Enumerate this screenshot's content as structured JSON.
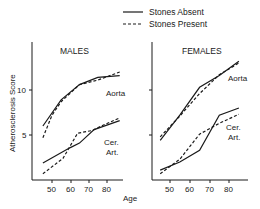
{
  "chart_data": [
    {
      "type": "line",
      "title": "MALES",
      "xlabel": "Age",
      "ylabel": "Atherosclerosis Score",
      "xticks": [
        50,
        60,
        70,
        80
      ],
      "yticks": [
        5,
        10
      ],
      "xlim": [
        40,
        90
      ],
      "ylim": [
        0,
        14
      ],
      "grid": false,
      "series": [
        {
          "name": "Stones Absent",
          "group": "Aorta",
          "style": "solid",
          "x": [
            45,
            55,
            65,
            75,
            87
          ],
          "y": [
            6.0,
            8.9,
            10.6,
            11.4,
            11.6
          ]
        },
        {
          "name": "Stones Present",
          "group": "Aorta",
          "style": "dashed",
          "x": [
            45,
            50,
            55,
            65,
            75,
            87
          ],
          "y": [
            4.7,
            7.2,
            8.7,
            10.6,
            11.1,
            12.0
          ]
        },
        {
          "name": "Stones Absent",
          "group": "Cer. Art.",
          "style": "solid",
          "x": [
            45,
            60,
            65,
            73,
            87
          ],
          "y": [
            1.9,
            3.6,
            4.1,
            5.6,
            6.6
          ]
        },
        {
          "name": "Stones Present",
          "group": "Cer. Art.",
          "style": "dashed",
          "x": [
            45,
            56,
            64,
            72,
            77,
            87
          ],
          "y": [
            0.7,
            2.4,
            5.2,
            5.5,
            6.0,
            6.9
          ]
        }
      ],
      "annotations": [
        "Aorta",
        "Cer. Art."
      ]
    },
    {
      "type": "line",
      "title": "FEMALES",
      "xlabel": "Age",
      "ylabel": "Atherosclerosis Score",
      "xticks": [
        50,
        60,
        70,
        80
      ],
      "yticks": [
        5,
        10
      ],
      "xlim": [
        40,
        90
      ],
      "ylim": [
        0,
        14
      ],
      "grid": false,
      "series": [
        {
          "name": "Stones Absent",
          "group": "Aorta",
          "style": "solid",
          "x": [
            45,
            55,
            65,
            75,
            85
          ],
          "y": [
            4.4,
            7.2,
            10.3,
            11.6,
            13.2
          ]
        },
        {
          "name": "Stones Present",
          "group": "Aorta",
          "style": "dashed",
          "x": [
            45,
            55,
            65,
            75,
            85
          ],
          "y": [
            4.8,
            7.1,
            9.6,
            11.7,
            13.0
          ]
        },
        {
          "name": "Stones Absent",
          "group": "Cer. Art.",
          "style": "solid",
          "x": [
            45,
            55,
            65,
            75,
            85
          ],
          "y": [
            1.1,
            2.0,
            3.3,
            7.2,
            8.0
          ]
        },
        {
          "name": "Stones Present",
          "group": "Cer. Art.",
          "style": "dashed",
          "x": [
            45,
            55,
            65,
            75,
            85
          ],
          "y": [
            0.7,
            2.3,
            5.1,
            6.3,
            7.3
          ]
        }
      ],
      "annotations": [
        "Aorta",
        "Cer. Art."
      ]
    }
  ],
  "legend": {
    "items": [
      {
        "label": "Stones Absent",
        "style": "solid"
      },
      {
        "label": "Stones Present",
        "style": "dashed"
      }
    ],
    "position": "top-center"
  },
  "labels": {
    "ylabel": "Atherosclerosis Score",
    "xlabel": "Age",
    "males_title": "MALES",
    "females_title": "FEMALES",
    "aorta": "Aorta",
    "cer": "Cer.",
    "art": "Art.",
    "tick_50": "50",
    "tick_60": "60",
    "tick_70": "70",
    "tick_80": "80",
    "ytick_10": "10",
    "ytick_5": "5"
  },
  "colors": {
    "ink": "#1a1a1a",
    "background": "#ffffff"
  }
}
